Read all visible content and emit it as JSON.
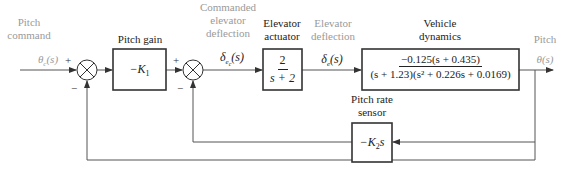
{
  "diagram": {
    "type": "block-diagram",
    "colors": {
      "line": "#555555",
      "box_border": "#333333",
      "grey_label": "#9a9a9a",
      "dark_label": "#222222"
    },
    "signals": {
      "input_label": [
        "Pitch",
        "command"
      ],
      "input_symbol": "θc(s)",
      "commanded_label": [
        "Commanded",
        "elevator",
        "deflection"
      ],
      "commanded_symbol": "δec(s)",
      "elevator_label": [
        "Elevator",
        "deflection"
      ],
      "elevator_symbol": "δe(s)",
      "output_label": "Pitch",
      "output_symbol": "θ(s)"
    },
    "summing_junctions": [
      {
        "id": "sum1",
        "signs": {
          "left": "+",
          "bottom": "−"
        }
      },
      {
        "id": "sum2",
        "signs": {
          "left": "+",
          "bottom": "−"
        }
      }
    ],
    "blocks": [
      {
        "id": "pitch-gain",
        "title": "Pitch gain",
        "content": "−K1"
      },
      {
        "id": "elevator-actuator",
        "title": [
          "Elevator",
          "actuator"
        ],
        "numerator": "2",
        "denominator": "s + 2"
      },
      {
        "id": "vehicle-dynamics",
        "title": [
          "Vehicle",
          "dynamics"
        ],
        "numerator": "−0.125(s + 0.435)",
        "denominator": "(s + 1.23)(s² + 0.226s + 0.0169)"
      },
      {
        "id": "pitch-rate-sensor",
        "title": [
          "Pitch rate",
          "sensor"
        ],
        "content": "−K2s"
      }
    ]
  }
}
